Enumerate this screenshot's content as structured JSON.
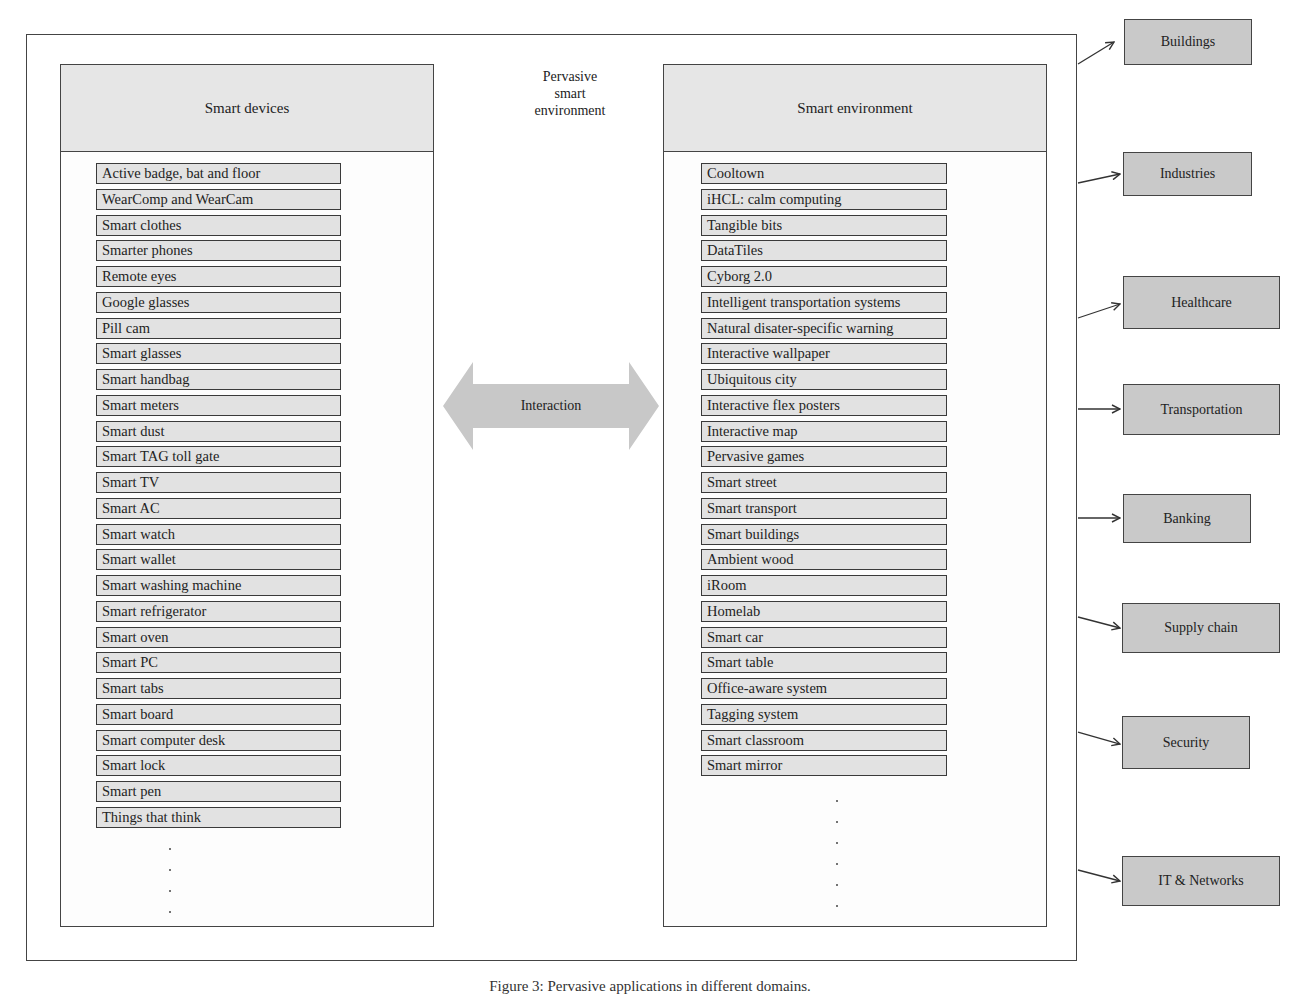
{
  "diagram": {
    "center_title": [
      "Pervasive",
      "smart",
      "environment"
    ],
    "interaction_label": "Interaction",
    "left_panel": {
      "title": "Smart devices",
      "items": [
        "Active badge, bat and floor",
        "WearComp and WearCam",
        "Smart clothes",
        "Smarter phones",
        "Remote eyes",
        "Google glasses",
        "Pill cam",
        "Smart glasses",
        "Smart handbag",
        "Smart meters",
        "Smart dust",
        "Smart TAG toll gate",
        "Smart TV",
        "Smart AC",
        "Smart watch",
        "Smart wallet",
        "Smart washing machine",
        "Smart refrigerator",
        "Smart oven",
        "Smart PC",
        "Smart tabs",
        "Smart board",
        "Smart computer desk",
        "Smart lock",
        "Smart pen",
        "Things that think"
      ],
      "continuation": "⋮"
    },
    "right_panel": {
      "title": "Smart environment",
      "items": [
        "Cooltown",
        "iHCL: calm computing",
        "Tangible bits",
        "DataTiles",
        "Cyborg 2.0",
        "Intelligent transportation systems",
        "Natural disater-specific warning",
        "Interactive wallpaper",
        "Ubiquitous city",
        "Interactive flex posters",
        "Interactive map",
        "Pervasive games",
        "Smart street",
        "Smart transport",
        "Smart buildings",
        "Ambient wood",
        "iRoom",
        "Homelab",
        "Smart car",
        "Smart table",
        "Office-aware system",
        "Tagging system",
        "Smart classroom",
        "Smart mirror"
      ],
      "continuation": "⋮"
    },
    "domains": [
      {
        "label": "Buildings"
      },
      {
        "label": "Industries"
      },
      {
        "label": "Healthcare"
      },
      {
        "label": "Transportation"
      },
      {
        "label": "Banking"
      },
      {
        "label": "Supply chain"
      },
      {
        "label": "Security"
      },
      {
        "label": "IT & Networks"
      }
    ],
    "caption": "Figure 3: Pervasive applications in different domains."
  },
  "colors": {
    "border": "#444444",
    "item_fill": "#e2e2e2",
    "header_fill": "#e6e6e6",
    "domain_fill": "#c9c9c9",
    "arrow_fill": "#c8c8c8"
  }
}
